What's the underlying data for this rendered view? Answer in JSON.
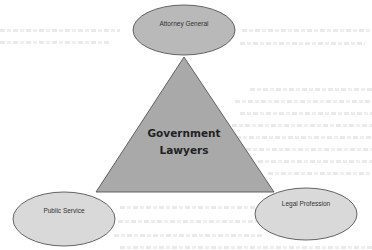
{
  "diagram": {
    "center": {
      "line1": "Government",
      "line2": "Lawyers"
    },
    "nodes": [
      {
        "id": "attorney-general",
        "label": "Attorney General"
      },
      {
        "id": "public-service",
        "label": "Public Service"
      },
      {
        "id": "legal-profession",
        "label": "Legal Profession"
      }
    ],
    "colors": {
      "triangle_fill": "#a9a9a9",
      "top_ellipse_fill": "#b9b9b9",
      "bottom_ellipse_fill": "#d9d9d9",
      "stroke": "#555555",
      "background": "#ffffff"
    }
  }
}
